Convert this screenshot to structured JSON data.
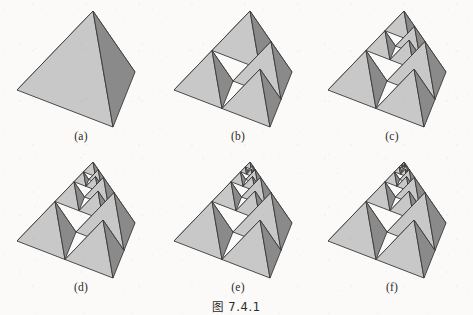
{
  "figure": {
    "caption": "图 7.4.1",
    "background_color": "#fbfaf8",
    "width": 473,
    "height": 315
  },
  "style": {
    "face_light": "#c8c8c8",
    "face_mid": "#a9a9a9",
    "face_dark": "#8a8a8a",
    "face_hole": "#ffffff",
    "edge_color": "#3a3a3a",
    "edge_width": 0.9
  },
  "panels": [
    {
      "id": "a",
      "label": "(a)",
      "iterations": 0,
      "description": "Solid tetrahedron, no subdivision"
    },
    {
      "id": "b",
      "label": "(b)",
      "iterations": 1,
      "description": "Tetrahedron subdivided into 4 sub-tetrahedra with central octahedral void"
    },
    {
      "id": "c",
      "label": "(c)",
      "iterations": 2,
      "description": "Top sub-tetrahedron subdivided one level deeper"
    },
    {
      "id": "d",
      "label": "(d)",
      "iterations": 3,
      "description": "Top sub-tetrahedron subdivided two levels deeper"
    },
    {
      "id": "e",
      "label": "(e)",
      "iterations": 4,
      "description": "Top sub-tetrahedron subdivided three levels deeper"
    },
    {
      "id": "f",
      "label": "(f)",
      "iterations": 5,
      "description": "Top sub-tetrahedron subdivided four levels deeper"
    }
  ]
}
